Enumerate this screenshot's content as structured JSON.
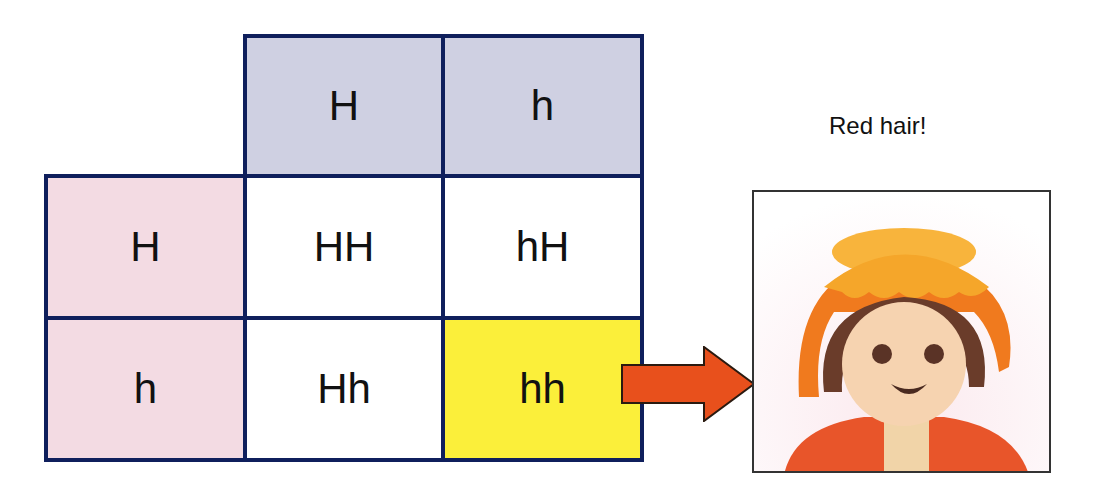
{
  "punnett": {
    "column_headers": [
      "H",
      "h"
    ],
    "row_headers": [
      "H",
      "h"
    ],
    "cells": [
      [
        "HH",
        "hH"
      ],
      [
        "Hh",
        "hh"
      ]
    ],
    "highlighted_cell": "hh"
  },
  "result": {
    "caption": "Red hair!",
    "image_description": "toy figure with red/orange hair"
  },
  "colors": {
    "grid_border": "#0f1f5c",
    "column_header_fill": "#cfd0e2",
    "row_header_fill": "#f3dbe3",
    "highlight_fill": "#fbef3a",
    "arrow_fill": "#e8501c"
  }
}
